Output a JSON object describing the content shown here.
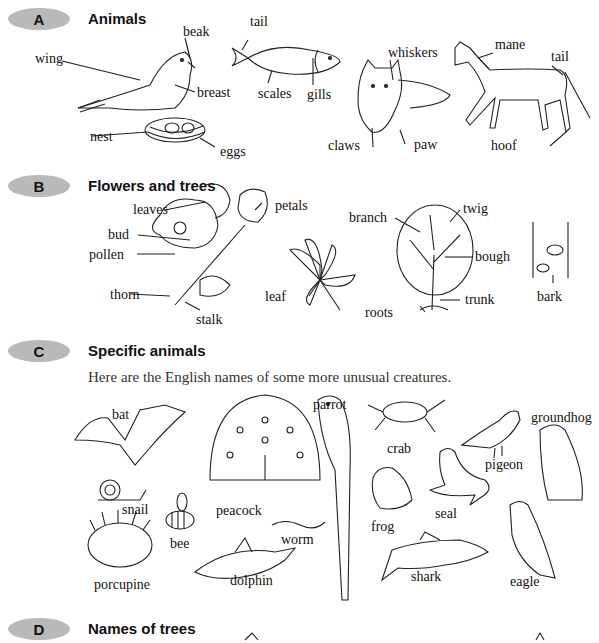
{
  "sections": [
    {
      "letter": "A",
      "title": "Animals",
      "labels": {
        "wing": "wing",
        "beak": "beak",
        "breast": "breast",
        "nest": "nest",
        "eggs": "eggs",
        "fish_tail": "tail",
        "scales": "scales",
        "gills": "gills",
        "whiskers": "whiskers",
        "claws": "claws",
        "paw": "paw",
        "mane": "mane",
        "horse_tail": "tail",
        "hoof": "hoof"
      }
    },
    {
      "letter": "B",
      "title": "Flowers and trees",
      "labels": {
        "leaves": "leaves",
        "bud": "bud",
        "pollen": "pollen",
        "thorn": "thorn",
        "stalk": "stalk",
        "petals": "petals",
        "leaf": "leaf",
        "branch": "branch",
        "twig": "twig",
        "bough": "bough",
        "trunk": "trunk",
        "roots": "roots",
        "bark": "bark"
      }
    },
    {
      "letter": "C",
      "title": "Specific animals",
      "intro": "Here are the English names of some more unusual creatures.",
      "labels": {
        "bat": "bat",
        "snail": "snail",
        "porcupine": "porcupine",
        "bee": "bee",
        "peacock": "peacock",
        "worm": "worm",
        "dolphin": "dolphin",
        "parrot": "parrot",
        "crab": "crab",
        "frog": "frog",
        "seal": "seal",
        "shark": "shark",
        "pigeon": "pigeon",
        "groundhog": "groundhog",
        "eagle": "eagle"
      }
    },
    {
      "letter": "D",
      "title": "Names of trees"
    }
  ],
  "colors": {
    "badge": "#b9b9b9",
    "text": "#111111"
  }
}
